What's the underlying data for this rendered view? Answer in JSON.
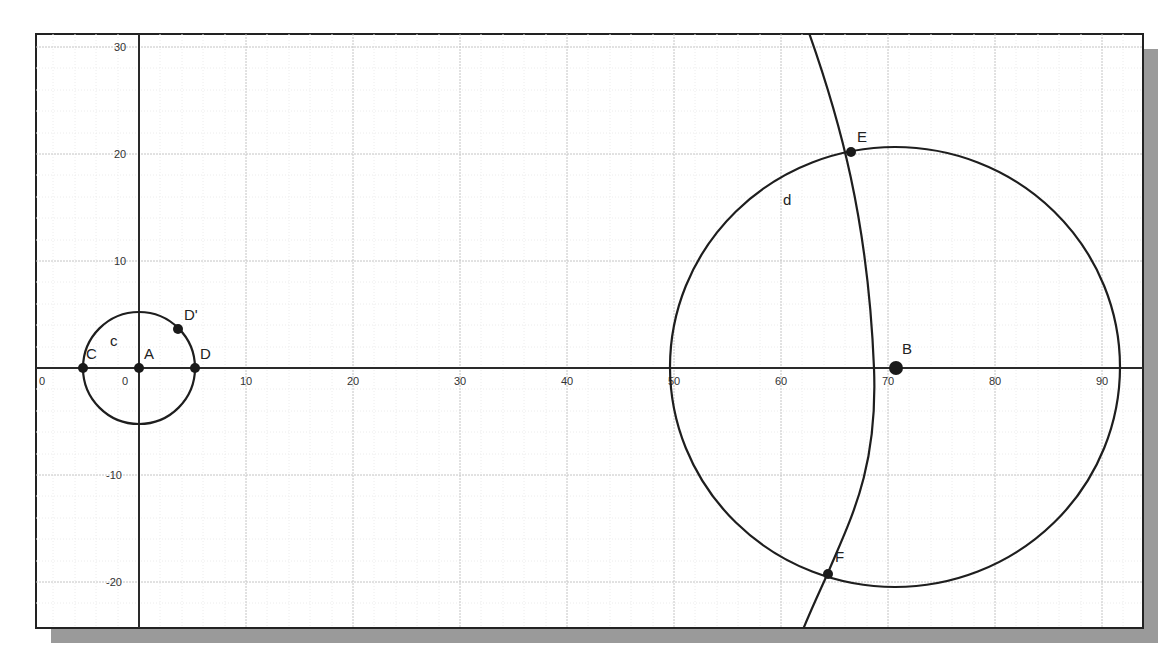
{
  "canvas": {
    "frame": {
      "left": 36,
      "top": 34,
      "right": 1143,
      "bottom": 628
    },
    "shadow_offset": 15,
    "origin_px": {
      "x": 139,
      "y": 368
    },
    "px_per_unit": 10.7
  },
  "axes": {
    "x_ticks": [
      {
        "value": 0,
        "label": "0",
        "px": 43,
        "note": "truncated -10 label at left edge"
      },
      {
        "value": 0,
        "label": "0",
        "px": 126
      },
      {
        "value": 10,
        "label": "10",
        "px": 246
      },
      {
        "value": 20,
        "label": "20",
        "px": 353
      },
      {
        "value": 30,
        "label": "30",
        "px": 460
      },
      {
        "value": 40,
        "label": "40",
        "px": 567
      },
      {
        "value": 50,
        "label": "50",
        "px": 674
      },
      {
        "value": 60,
        "label": "60",
        "px": 781
      },
      {
        "value": 70,
        "label": "70",
        "px": 888
      },
      {
        "value": 80,
        "label": "80",
        "px": 995
      },
      {
        "value": 90,
        "label": "90",
        "px": 1102
      }
    ],
    "y_ticks": [
      {
        "value": 30,
        "label": "30",
        "px": 47
      },
      {
        "value": 20,
        "label": "20",
        "px": 154
      },
      {
        "value": 10,
        "label": "10",
        "px": 261
      },
      {
        "value": -10,
        "label": "-10",
        "px": 475
      },
      {
        "value": -20,
        "label": "-20",
        "px": 582
      }
    ]
  },
  "objects": {
    "circle_c": {
      "label": "c",
      "center": "A",
      "radius_units": 5.3
    },
    "circle_d": {
      "label": "d",
      "center": "B",
      "radius_units": 21
    },
    "arc": {
      "through": [
        "E",
        "F"
      ]
    }
  },
  "points": {
    "A": {
      "label": "A",
      "x": 0,
      "y": 0
    },
    "B": {
      "label": "B",
      "x": 70.7,
      "y": 0
    },
    "C": {
      "label": "C",
      "x": -5.3,
      "y": 0
    },
    "D": {
      "label": "D",
      "x": 5.3,
      "y": 0
    },
    "D_prime": {
      "label": "D'",
      "x": 3.7,
      "y": 3.7
    },
    "E": {
      "label": "E",
      "x": 66.5,
      "y": 20
    },
    "F": {
      "label": "F",
      "x": 64,
      "y": -19.3
    }
  },
  "labels": {
    "circle_c": "c",
    "circle_d": "d",
    "A": "A",
    "B": "B",
    "C": "C",
    "D": "D",
    "D_prime": "D'",
    "E": "E",
    "F": "F"
  },
  "ticks": {
    "x_m10_trunc": "0",
    "x0": "0",
    "x10": "10",
    "x20": "20",
    "x30": "30",
    "x40": "40",
    "x50": "50",
    "x60": "60",
    "x70": "70",
    "x80": "80",
    "x90": "90",
    "y30": "30",
    "y20": "20",
    "y10": "10",
    "ym10": "-10",
    "ym20": "-20"
  }
}
